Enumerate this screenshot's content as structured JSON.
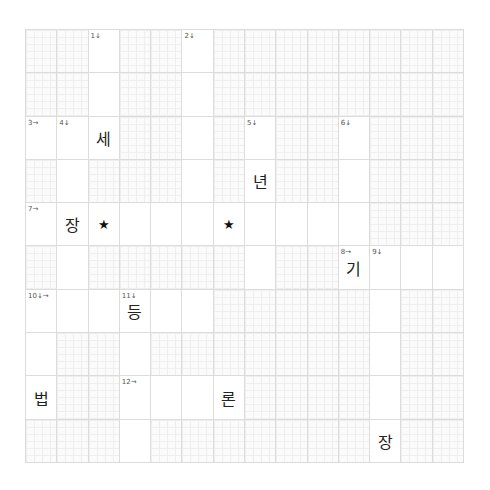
{
  "puzzle": {
    "rows": 10,
    "cols": 14,
    "white_cells": [
      [
        2,
        5
      ],
      [
        2,
        5
      ],
      [
        0,
        1,
        2,
        5,
        7,
        10
      ],
      [
        1,
        5,
        7,
        10
      ],
      [
        0,
        1,
        2,
        3,
        4,
        5,
        6,
        7,
        8,
        9,
        10
      ],
      [
        1,
        7,
        10,
        11,
        12,
        13
      ],
      [
        0,
        1,
        2,
        3,
        4,
        5,
        11
      ],
      [
        0,
        3,
        11
      ],
      [
        0,
        3,
        4,
        5,
        6,
        11
      ],
      [
        3,
        11
      ]
    ],
    "clue_numbers": [
      {
        "r": 0,
        "c": 2,
        "label": "1↓"
      },
      {
        "r": 0,
        "c": 5,
        "label": "2↓"
      },
      {
        "r": 2,
        "c": 0,
        "label": "3→"
      },
      {
        "r": 2,
        "c": 1,
        "label": "4↓"
      },
      {
        "r": 2,
        "c": 7,
        "label": "5↓"
      },
      {
        "r": 2,
        "c": 10,
        "label": "6↓"
      },
      {
        "r": 4,
        "c": 0,
        "label": "7→"
      },
      {
        "r": 5,
        "c": 10,
        "label": "8→"
      },
      {
        "r": 5,
        "c": 11,
        "label": "9↓"
      },
      {
        "r": 6,
        "c": 0,
        "label": "10↓→"
      },
      {
        "r": 6,
        "c": 3,
        "label": "11↓"
      },
      {
        "r": 8,
        "c": 3,
        "label": "12→"
      }
    ],
    "letters": [
      {
        "r": 2,
        "c": 2,
        "char": "세"
      },
      {
        "r": 3,
        "c": 7,
        "char": "년"
      },
      {
        "r": 4,
        "c": 1,
        "char": "장"
      },
      {
        "r": 4,
        "c": 2,
        "char": "★",
        "star": true
      },
      {
        "r": 4,
        "c": 6,
        "char": "★",
        "star": true
      },
      {
        "r": 5,
        "c": 10,
        "char": "기"
      },
      {
        "r": 6,
        "c": 3,
        "char": "등"
      },
      {
        "r": 8,
        "c": 0,
        "char": "법"
      },
      {
        "r": 8,
        "c": 6,
        "char": "론"
      },
      {
        "r": 9,
        "c": 11,
        "char": "장"
      }
    ]
  }
}
